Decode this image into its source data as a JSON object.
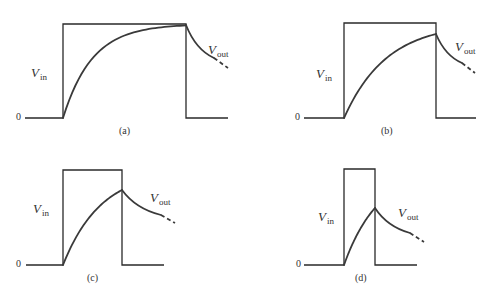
{
  "figure": {
    "panels": [
      {
        "id": "a",
        "caption": "(a)",
        "zero_label": "0",
        "vin_label": {
          "main": "V",
          "sub": "in"
        },
        "vout_label": {
          "main": "V",
          "sub": "out"
        },
        "geometry": {
          "baseline_y": 118,
          "baseline_start_x": 25,
          "baseline_end_x": 228,
          "pulse_left_x": 63,
          "pulse_right_x": 186,
          "pulse_top_y": 24,
          "vout_peak_y": 25,
          "decay_solid_end": [
            214,
            58
          ],
          "decay_dash_end": [
            228,
            68
          ]
        },
        "label_pos": {
          "zero": [
            16,
            112
          ],
          "vin": [
            31,
            66
          ],
          "vout": [
            208,
            43
          ],
          "caption": [
            119,
            126
          ]
        }
      },
      {
        "id": "b",
        "caption": "(b)",
        "zero_label": "0",
        "vin_label": {
          "main": "V",
          "sub": "in"
        },
        "vout_label": {
          "main": "V",
          "sub": "out"
        },
        "geometry": {
          "baseline_y": 118,
          "baseline_start_x": 304,
          "baseline_end_x": 476,
          "pulse_left_x": 344,
          "pulse_right_x": 436,
          "pulse_top_y": 23,
          "vout_peak_y": 34,
          "decay_solid_end": [
            462,
            63
          ],
          "decay_dash_end": [
            475,
            73
          ]
        },
        "label_pos": {
          "zero": [
            295,
            112
          ],
          "vin": [
            316,
            67
          ],
          "vout": [
            455,
            40
          ],
          "caption": [
            381,
            126
          ]
        }
      },
      {
        "id": "c",
        "caption": "(c)",
        "zero_label": "0",
        "vin_label": {
          "main": "V",
          "sub": "in"
        },
        "vout_label": {
          "main": "V",
          "sub": "out"
        },
        "geometry": {
          "baseline_y": 265,
          "baseline_start_x": 26,
          "baseline_end_x": 164,
          "pulse_left_x": 63,
          "pulse_right_x": 122,
          "pulse_top_y": 170,
          "vout_peak_y": 190,
          "decay_solid_end": [
            161,
            215
          ],
          "decay_dash_end": [
            175,
            223
          ]
        },
        "label_pos": {
          "zero": [
            16,
            259
          ],
          "vin": [
            33,
            202
          ],
          "vout": [
            150,
            191
          ],
          "caption": [
            87,
            273
          ]
        }
      },
      {
        "id": "d",
        "caption": "(d)",
        "zero_label": "0",
        "vin_label": {
          "main": "V",
          "sub": "in"
        },
        "vout_label": {
          "main": "V",
          "sub": "out"
        },
        "geometry": {
          "baseline_y": 265,
          "baseline_start_x": 304,
          "baseline_end_x": 417,
          "pulse_left_x": 344,
          "pulse_right_x": 375,
          "pulse_top_y": 169,
          "vout_peak_y": 208,
          "decay_solid_end": [
            410,
            233
          ],
          "decay_dash_end": [
            424,
            242
          ]
        },
        "label_pos": {
          "zero": [
            296,
            259
          ],
          "vin": [
            318,
            210
          ],
          "vout": [
            398,
            206
          ],
          "caption": [
            355,
            273
          ]
        }
      }
    ]
  }
}
